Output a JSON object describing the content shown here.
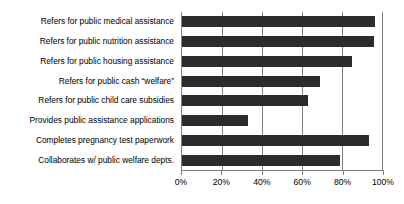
{
  "chart_data": {
    "type": "bar",
    "orientation": "horizontal",
    "title": "",
    "xlabel": "",
    "ylabel": "",
    "xlim": [
      0,
      100
    ],
    "xtick_labels": [
      "0%",
      "20%",
      "40%",
      "60%",
      "80%",
      "100%"
    ],
    "xticks": [
      0,
      20,
      40,
      60,
      80,
      100
    ],
    "grid": true,
    "legend": false,
    "bar_color": "#2b2b2b",
    "axis_color": "#808080",
    "background_color": "#ffffff",
    "categories": [
      "Refers for public medical assistance",
      "Refers for public nutrition assistance",
      "Refers for public housing assistance",
      "Refers for public cash “welfare”",
      "Refers for public child care subsidies",
      "Provides public assistance applications",
      "Completes pregnancy test paperwork",
      "Collaborates w/ public welfare depts."
    ],
    "values": [
      96.5,
      96,
      85,
      69,
      63,
      33,
      93.5,
      79
    ]
  }
}
